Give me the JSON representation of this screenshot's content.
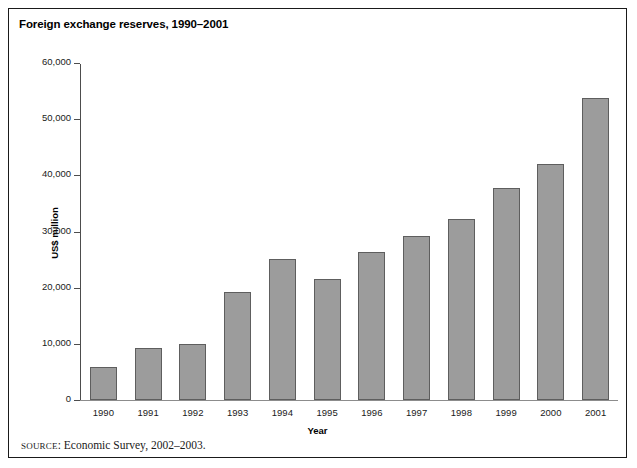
{
  "figure": {
    "title": "Foreign exchange reserves, 1990–2001",
    "source_prefix": "SOURCE",
    "source_separator": ": ",
    "source_text": "Economic Survey, 2002–2003."
  },
  "chart_data": {
    "type": "bar",
    "title": "Foreign exchange reserves, 1990–2001",
    "xlabel": "Year",
    "ylabel": "US$ million",
    "categories": [
      "1990",
      "1991",
      "1992",
      "1993",
      "1994",
      "1995",
      "1996",
      "1997",
      "1998",
      "1999",
      "2000",
      "2001"
    ],
    "values": [
      5900,
      9200,
      10000,
      19200,
      25100,
      21600,
      26400,
      29300,
      32300,
      37900,
      42200,
      53900
    ],
    "ylim": [
      0,
      60000
    ],
    "ytick_values": [
      0,
      10000,
      20000,
      30000,
      40000,
      50000,
      60000
    ],
    "ytick_labels": [
      "0",
      "10,000",
      "20,000",
      "30,000",
      "40,000",
      "50,000",
      "60,000"
    ],
    "grid": false,
    "legend": null,
    "bar_color": "#9c9c9c",
    "bar_edge_color": "#5e5e5e",
    "axis_color": "#4d4d4d",
    "background": "#ffffff"
  }
}
